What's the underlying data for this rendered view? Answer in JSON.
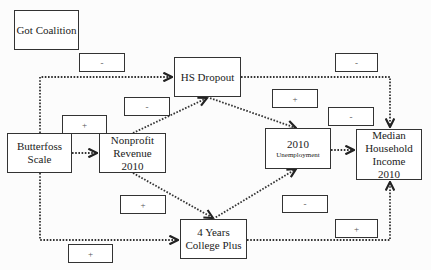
{
  "diagram": {
    "nodes": {
      "got_coalition": "Got Coalition",
      "hs_dropout": "HS Dropout",
      "butterfoss_scale": "Butterfoss Scale",
      "nonprofit_revenue": "Nonprofit Revenue 2010",
      "unemployment_year": "2010",
      "unemployment_label": "Unemployment",
      "median_income": "Median Household Income 2010",
      "college_plus": "4 Years College Plus"
    },
    "signs": {
      "coalition_to_hs": "-",
      "hs_to_income": "-",
      "nonprofit_to_hs": "-",
      "butterfoss_to_nonprofit": "+",
      "hs_to_unemployment": "+",
      "unemployment_to_income": "-",
      "nonprofit_to_college": "+",
      "college_to_unemployment": "-",
      "college_to_income": "+",
      "butterfoss_to_college": "+"
    },
    "edges": [
      {
        "from": "Butterfoss Scale",
        "to": "HS Dropout",
        "sign": "-"
      },
      {
        "from": "Butterfoss Scale",
        "to": "Nonprofit Revenue 2010",
        "sign": "+"
      },
      {
        "from": "Butterfoss Scale",
        "to": "4 Years College Plus",
        "sign": "+"
      },
      {
        "from": "Nonprofit Revenue 2010",
        "to": "HS Dropout",
        "sign": "-"
      },
      {
        "from": "Nonprofit Revenue 2010",
        "to": "4 Years College Plus",
        "sign": "+"
      },
      {
        "from": "HS Dropout",
        "to": "2010 Unemployment",
        "sign": "+"
      },
      {
        "from": "HS Dropout",
        "to": "Median Household Income 2010",
        "sign": "-"
      },
      {
        "from": "4 Years College Plus",
        "to": "2010 Unemployment",
        "sign": "-"
      },
      {
        "from": "4 Years College Plus",
        "to": "Median Household Income 2010",
        "sign": "+"
      },
      {
        "from": "2010 Unemployment",
        "to": "Median Household Income 2010",
        "sign": "-"
      }
    ],
    "colors": {
      "line": "#333333",
      "box_border": "#333333",
      "background": "#fcfcfc"
    }
  }
}
